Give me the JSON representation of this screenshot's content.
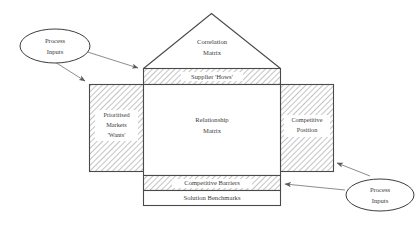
{
  "diagram": {
    "type": "house-of-quality",
    "colors": {
      "outline": "#4a4a4a",
      "hatch": "#b4b4b4",
      "text": "#3a3a3a",
      "background": "#ffffff"
    },
    "rooms": {
      "roof": {
        "name": "correlation-matrix",
        "label_line1": "Correlation",
        "label_line2": "Matrix",
        "fill": "white"
      },
      "hows": {
        "name": "supplier-hows",
        "label": "Supplier 'Hows'",
        "fill": "hatched"
      },
      "wants": {
        "name": "prioritised-markets-wants",
        "label_line1": "Prioritised",
        "label_line2": "Markets",
        "label_line3": "'Wants'",
        "fill": "hatched"
      },
      "center": {
        "name": "relationship-matrix",
        "label_line1": "Relationship",
        "label_line2": "Matrix",
        "fill": "white"
      },
      "competitive_position": {
        "name": "competitive-position",
        "label_line1": "Competitive",
        "label_line2": "Position",
        "fill": "hatched"
      },
      "barriers": {
        "name": "competitive-barriers",
        "label": "Competitive Barriers",
        "fill": "hatched"
      },
      "benchmarks": {
        "name": "solution-benchmarks",
        "label": "Solution Benchmarks",
        "fill": "white"
      }
    },
    "callouts": [
      {
        "name": "process-inputs-left",
        "label_line1": "Process",
        "label_line2": "Inputs",
        "position": "top-left",
        "targets": [
          "supplier-hows",
          "prioritised-markets-wants"
        ]
      },
      {
        "name": "process-inputs-right",
        "label_line1": "Process",
        "label_line2": "Inputs",
        "position": "bottom-right",
        "targets": [
          "competitive-position",
          "competitive-barriers"
        ]
      }
    ]
  }
}
